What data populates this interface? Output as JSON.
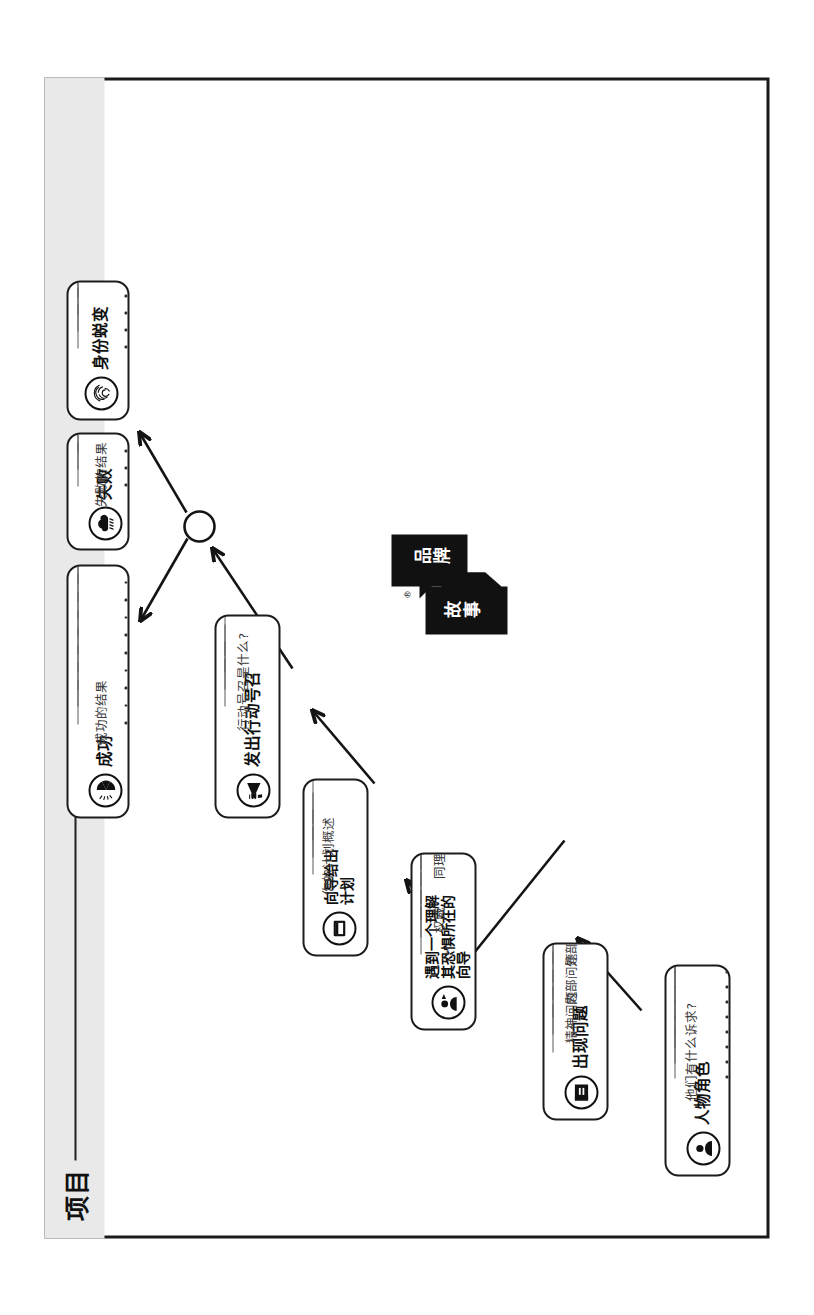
{
  "header": {
    "project_label": "项目",
    "sheet_title": "一页式品牌脚本"
  },
  "logo": {
    "brand_word": "品牌",
    "story_word": "故事",
    "registered_mark": "®"
  },
  "cards": [
    {
      "id": "character",
      "icon": "person-icon",
      "title": "人物角色",
      "subtitle": "他们有什么诉求?",
      "sub_labels": [],
      "write_lines": 8,
      "dots": 8
    },
    {
      "id": "problem",
      "icon": "lightning-bolt-icon",
      "title": "出现问题",
      "subtitle": "",
      "sub_labels": [
        "外部问题",
        "内部问题",
        "精神问题"
      ],
      "write_lines": 6,
      "dots": 0
    },
    {
      "id": "guide",
      "icon": "guide-person-icon",
      "title": "遇到一个理解\n其恐惧所在的\n向导",
      "subtitle": "",
      "sub_labels": [
        "同理心",
        "权威"
      ],
      "write_lines": 6,
      "dots": 0
    },
    {
      "id": "plan",
      "icon": "clipboard-icon",
      "title": "向导给出\n计划",
      "subtitle": "你的计划概述",
      "sub_labels": [],
      "write_lines": 4,
      "dots": 0
    },
    {
      "id": "call-to-action",
      "icon": "megaphone-icon",
      "title": "发出行动号召",
      "subtitle": "行动号召是什么?",
      "sub_labels": [],
      "write_lines": 4,
      "dots": 0
    },
    {
      "id": "success",
      "icon": "trophy-medal-icon",
      "title": "成功",
      "subtitle": "成功的结果",
      "sub_labels": [],
      "write_lines": 9,
      "dots": 9
    },
    {
      "id": "failure",
      "icon": "storm-cloud-icon",
      "title": "失败",
      "subtitle": "失败的结果",
      "sub_labels": [],
      "write_lines": 3,
      "dots": 3
    },
    {
      "id": "transformation",
      "icon": "fingerprint-icon",
      "title": "身份蜕变",
      "subtitle": "",
      "sub_labels": [],
      "write_lines": 4,
      "dots": 4
    }
  ],
  "colors": {
    "ink": "#1a1a1a",
    "paper": "#ffffff",
    "header_strip": "#e9e9e9",
    "rule": "#5d5d5d"
  }
}
